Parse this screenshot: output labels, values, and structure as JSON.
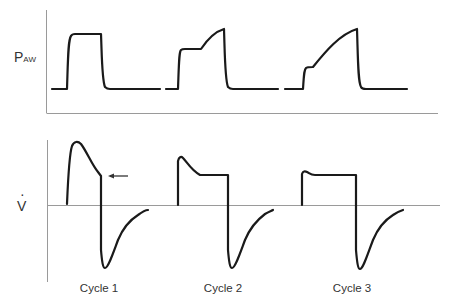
{
  "figure": {
    "pressure_panel": {
      "ylabel_main": "P",
      "ylabel_sub": "AW"
    },
    "flow_panel": {
      "ylabel": "V",
      "ylabel_dot": "·"
    },
    "cycles": [
      {
        "label": "Cycle 1"
      },
      {
        "label": "Cycle 2"
      },
      {
        "label": "Cycle 3"
      }
    ],
    "colors": {
      "waveform": "#1a1a1a",
      "axis": "#9a9a9a",
      "text": "#333333"
    }
  }
}
